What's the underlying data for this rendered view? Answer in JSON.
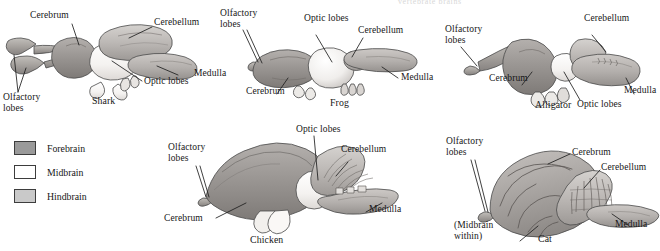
{
  "figure": {
    "title_fragment": "vertebrate brains",
    "background_color": "#ffffff",
    "text_color": "#161616"
  },
  "legend": {
    "name": "brain-region-legend",
    "items": [
      {
        "label": "Forebrain",
        "color": "#9a9a9a",
        "border": "#3d3d3d"
      },
      {
        "label": "Midbrain",
        "color": "#ffffff",
        "border": "#3d3d3d"
      },
      {
        "label": "Hindbrain",
        "color": "#c9c9c9",
        "border": "#3d3d3d"
      }
    ]
  },
  "specimens": [
    {
      "id": "shark",
      "name": "Shark",
      "caption": "Shark",
      "labels": [
        "Cerebrum",
        "Cerebellum",
        "Medulla",
        "Optic lobes",
        "Olfactory lobes"
      ]
    },
    {
      "id": "frog",
      "name": "Frog",
      "caption": "Frog",
      "labels": [
        "Olfactory lobes",
        "Optic lobes",
        "Cerebellum",
        "Medulla",
        "Cerebrum"
      ]
    },
    {
      "id": "alligator",
      "name": "Alligator",
      "caption": "Alligator",
      "labels": [
        "Olfactory lobes",
        "Cerebellum",
        "Cerebrum",
        "Optic lobes",
        "Medulla"
      ]
    },
    {
      "id": "chicken",
      "name": "Chicken",
      "caption": "Chicken",
      "labels": [
        "Olfactory lobes",
        "Optic lobes",
        "Cerebellum",
        "Cerebrum",
        "Medulla"
      ]
    },
    {
      "id": "cat",
      "name": "Cat",
      "caption": "Cat",
      "labels": [
        "Olfactory lobes",
        "Cerebrum",
        "Cerebellum",
        "(Midbrain within)",
        "Medulla"
      ]
    }
  ],
  "callouts": {
    "shark_cerebrum": "Cerebrum",
    "shark_cerebellum": "Cerebellum",
    "shark_medulla": "Medulla",
    "shark_optic_lobes": "Optic lobes",
    "shark_olfactory_line1": "Olfactory",
    "shark_olfactory_line2": "lobes",
    "shark_caption": "Shark",
    "frog_olfactory_line1": "Olfactory",
    "frog_olfactory_line2": "lobes",
    "frog_optic_lobes": "Optic lobes",
    "frog_cerebellum": "Cerebellum",
    "frog_medulla": "Medulla",
    "frog_cerebrum": "Cerebrum",
    "frog_caption": "Frog",
    "alligator_olfactory_line1": "Olfactory",
    "alligator_olfactory_line2": "lobes",
    "alligator_cerebellum": "Cerebellum",
    "alligator_cerebrum": "Cerebrum",
    "alligator_optic_lobes": "Optic lobes",
    "alligator_medulla": "Medulla",
    "alligator_caption": "Alligator",
    "chicken_olfactory_line1": "Olfactory",
    "chicken_olfactory_line2": "lobes",
    "chicken_optic_lobes": "Optic lobes",
    "chicken_cerebellum": "Cerebellum",
    "chicken_cerebrum": "Cerebrum",
    "chicken_medulla": "Medulla",
    "chicken_caption": "Chicken",
    "cat_olfactory_line1": "Olfactory",
    "cat_olfactory_line2": "lobes",
    "cat_cerebrum": "Cerebrum",
    "cat_cerebellum": "Cerebellum",
    "cat_midbrain_line1": "(Midbrain",
    "cat_midbrain_line2": "within)",
    "cat_medulla": "Medulla",
    "cat_caption": "Cat"
  }
}
